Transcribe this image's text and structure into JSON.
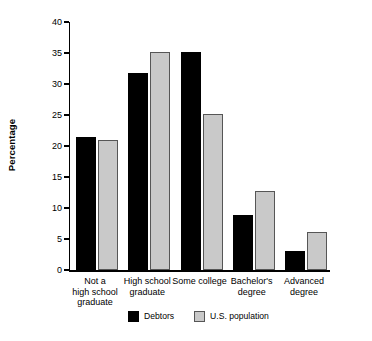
{
  "chart_data": {
    "type": "bar",
    "title": "",
    "xlabel": "",
    "ylabel": "Percentage",
    "ylim": [
      0,
      40
    ],
    "yticks": [
      0,
      5,
      10,
      15,
      20,
      25,
      30,
      35,
      40
    ],
    "grid": false,
    "legend_position": "bottom-center",
    "categories": [
      "Not a\nhigh school\ngraduate",
      "High school\ngraduate",
      "Some college",
      "Bachelor's\ndegree",
      "Advanced\ndegree"
    ],
    "series": [
      {
        "name": "Debtors",
        "color": "#000000",
        "values": [
          21.5,
          31.8,
          35.2,
          8.8,
          3.1
        ]
      },
      {
        "name": "U.S. population",
        "color": "#c9c9c9",
        "values": [
          20.9,
          35.2,
          25.1,
          12.7,
          6.1
        ]
      }
    ]
  },
  "axis": {
    "y_title": "Percentage",
    "y_tick_labels": [
      "40",
      "35",
      "30",
      "25",
      "20",
      "15",
      "10",
      "5",
      "0"
    ]
  },
  "legend": {
    "items": [
      {
        "label": "Debtors",
        "swatch": "black-square-swatch"
      },
      {
        "label": "U.S. population",
        "swatch": "gray-square-swatch"
      }
    ]
  }
}
